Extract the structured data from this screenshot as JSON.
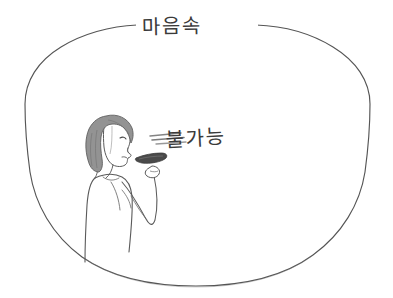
{
  "image": {
    "kind": "hand-drawn-sketch",
    "background_color": "#ffffff",
    "width": 393,
    "height": 298
  },
  "annotations": {
    "top_caption": "마음속",
    "center_caption": "불가능"
  },
  "drawing": {
    "frame": {
      "shape": "ellipse",
      "stroke_color": "#555555",
      "fill": "none",
      "center_x": 196,
      "center_y": 152,
      "radius_x": 170,
      "radius_y": 130
    },
    "figure": {
      "label": "person-erasing",
      "facing": "right",
      "outline_color": "#555555",
      "hair_fill_color": "#939393",
      "hair_style": "bob-cut",
      "skin_line_color": "#5a5a5a",
      "held_object": "eraser",
      "held_object_color": "#4a4a4a"
    },
    "erase_marks": {
      "label": "erasing-strokes",
      "color": "#6e6e6e",
      "count": 3
    }
  }
}
